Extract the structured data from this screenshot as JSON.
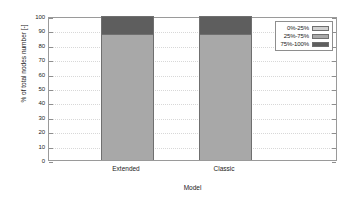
{
  "chart_data": {
    "type": "bar",
    "subtype": "stacked-bar",
    "title": "",
    "xlabel": "Model",
    "ylabel": "% of total nodes number [-]",
    "categories": [
      "Extended",
      "Classic"
    ],
    "series": [
      {
        "name": "0%-25%",
        "values": [
          0,
          0
        ],
        "color": "#d0d0d0"
      },
      {
        "name": "25%-75%",
        "values": [
          87.5,
          87.5
        ],
        "color": "#a8a8a8"
      },
      {
        "name": "75%-100%",
        "values": [
          12.5,
          12.5
        ],
        "color": "#5e5e5e"
      }
    ],
    "ylim": [
      0,
      100
    ],
    "yticks": [
      0,
      10,
      20,
      30,
      40,
      50,
      60,
      70,
      80,
      90,
      100
    ],
    "ytick_labels": [
      "0",
      "10",
      "20",
      "30",
      "40",
      "50",
      "60",
      "70",
      "80",
      "90",
      "100"
    ],
    "grid": true,
    "grid_style": "dotted",
    "legend_position": "top-right-inside",
    "frame_color": "#9a9a9a",
    "bar_edge_color": "#6f6f6f",
    "background": "#ffffff"
  },
  "legend": {
    "entries": [
      {
        "label": "0%-25%"
      },
      {
        "label": "25%-75%"
      },
      {
        "label": "75%-100%"
      }
    ]
  }
}
